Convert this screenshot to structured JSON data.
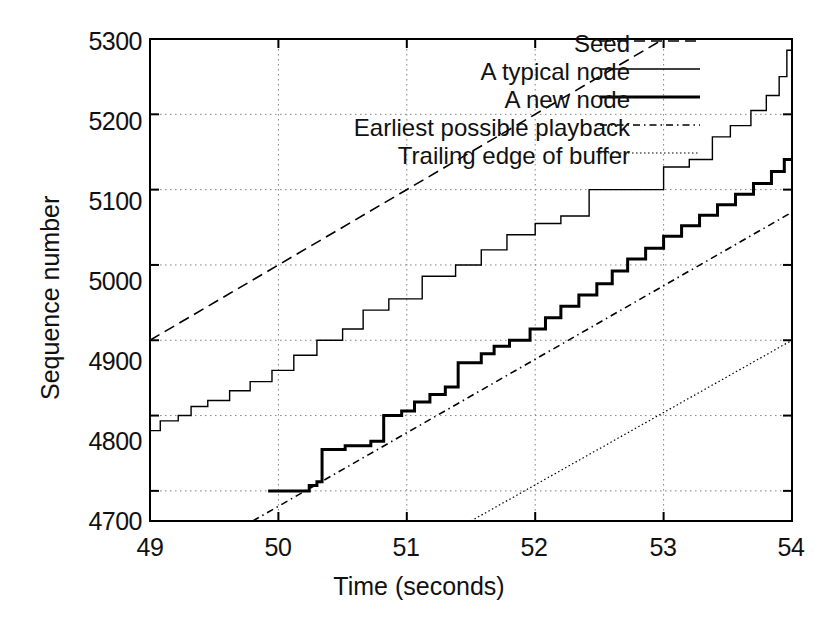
{
  "chart_data": {
    "type": "line",
    "title": "",
    "xlabel": "Time (seconds)",
    "ylabel": "Sequence number",
    "xlim": [
      49,
      54
    ],
    "ylim": [
      4660,
      5300
    ],
    "xticks": [
      49,
      50,
      51,
      52,
      53,
      54
    ],
    "yticks": [
      4700,
      4800,
      4900,
      5000,
      5100,
      5200,
      5300
    ],
    "grid": true,
    "legend_position": "top-center",
    "series": [
      {
        "name": "Seed",
        "style": "dashed",
        "width": 1.6,
        "note": "straight line, 100 sequence numbers per second, exits top of plot at t=53",
        "points": [
          [
            49,
            4900
          ],
          [
            53,
            5300
          ]
        ]
      },
      {
        "name": "A typical node",
        "style": "solid-thin",
        "width": 1.4,
        "note": "staircase, roughly 100 seq/sec average, starts 4780 ends 5290",
        "points": [
          [
            49.0,
            4780
          ],
          [
            49.08,
            4780
          ],
          [
            49.08,
            4793
          ],
          [
            49.22,
            4793
          ],
          [
            49.22,
            4800
          ],
          [
            49.32,
            4800
          ],
          [
            49.32,
            4812
          ],
          [
            49.45,
            4812
          ],
          [
            49.45,
            4820
          ],
          [
            49.62,
            4820
          ],
          [
            49.62,
            4833
          ],
          [
            49.78,
            4833
          ],
          [
            49.78,
            4845
          ],
          [
            49.95,
            4845
          ],
          [
            49.95,
            4860
          ],
          [
            50.12,
            4860
          ],
          [
            50.12,
            4880
          ],
          [
            50.3,
            4880
          ],
          [
            50.3,
            4900
          ],
          [
            50.5,
            4900
          ],
          [
            50.5,
            4915
          ],
          [
            50.66,
            4915
          ],
          [
            50.66,
            4940
          ],
          [
            50.86,
            4940
          ],
          [
            50.86,
            4955
          ],
          [
            51.12,
            4955
          ],
          [
            51.12,
            4985
          ],
          [
            51.38,
            4985
          ],
          [
            51.38,
            5000
          ],
          [
            51.58,
            5000
          ],
          [
            51.58,
            5020
          ],
          [
            51.78,
            5020
          ],
          [
            51.78,
            5040
          ],
          [
            52.0,
            5040
          ],
          [
            52.0,
            5055
          ],
          [
            52.2,
            5055
          ],
          [
            52.2,
            5065
          ],
          [
            52.42,
            5065
          ],
          [
            52.42,
            5100
          ],
          [
            53.0,
            5100
          ],
          [
            53.0,
            5130
          ],
          [
            53.2,
            5130
          ],
          [
            53.2,
            5140
          ],
          [
            53.38,
            5140
          ],
          [
            53.38,
            5170
          ],
          [
            53.52,
            5170
          ],
          [
            53.52,
            5185
          ],
          [
            53.68,
            5185
          ],
          [
            53.68,
            5205
          ],
          [
            53.8,
            5205
          ],
          [
            53.8,
            5225
          ],
          [
            53.9,
            5225
          ],
          [
            53.9,
            5250
          ],
          [
            53.96,
            5250
          ],
          [
            53.96,
            5285
          ],
          [
            54.0,
            5285
          ]
        ]
      },
      {
        "name": "A new node",
        "style": "solid-thick",
        "width": 3.0,
        "note": "flat at 4700 until t=50.3, then fine staircase up to 5140 at t=54",
        "points": [
          [
            49.92,
            4700
          ],
          [
            50.24,
            4700
          ],
          [
            50.24,
            4707
          ],
          [
            50.3,
            4707
          ],
          [
            50.3,
            4712
          ],
          [
            50.34,
            4712
          ],
          [
            50.34,
            4755
          ],
          [
            50.52,
            4755
          ],
          [
            50.52,
            4760
          ],
          [
            50.72,
            4760
          ],
          [
            50.72,
            4766
          ],
          [
            50.82,
            4766
          ],
          [
            50.82,
            4800
          ],
          [
            50.96,
            4800
          ],
          [
            50.96,
            4806
          ],
          [
            51.06,
            4806
          ],
          [
            51.06,
            4818
          ],
          [
            51.18,
            4818
          ],
          [
            51.18,
            4828
          ],
          [
            51.3,
            4828
          ],
          [
            51.3,
            4838
          ],
          [
            51.4,
            4838
          ],
          [
            51.4,
            4870
          ],
          [
            51.58,
            4870
          ],
          [
            51.58,
            4882
          ],
          [
            51.68,
            4882
          ],
          [
            51.68,
            4892
          ],
          [
            51.8,
            4892
          ],
          [
            51.8,
            4900
          ],
          [
            51.96,
            4900
          ],
          [
            51.96,
            4915
          ],
          [
            52.08,
            4915
          ],
          [
            52.08,
            4930
          ],
          [
            52.2,
            4930
          ],
          [
            52.2,
            4945
          ],
          [
            52.34,
            4945
          ],
          [
            52.34,
            4960
          ],
          [
            52.48,
            4960
          ],
          [
            52.48,
            4975
          ],
          [
            52.6,
            4975
          ],
          [
            52.6,
            4992
          ],
          [
            52.72,
            4992
          ],
          [
            52.72,
            5008
          ],
          [
            52.86,
            5008
          ],
          [
            52.86,
            5022
          ],
          [
            53.0,
            5022
          ],
          [
            53.0,
            5038
          ],
          [
            53.14,
            5038
          ],
          [
            53.14,
            5052
          ],
          [
            53.28,
            5052
          ],
          [
            53.28,
            5066
          ],
          [
            53.42,
            5066
          ],
          [
            53.42,
            5080
          ],
          [
            53.56,
            5080
          ],
          [
            53.56,
            5094
          ],
          [
            53.7,
            5094
          ],
          [
            53.7,
            5108
          ],
          [
            53.84,
            5108
          ],
          [
            53.84,
            5124
          ],
          [
            53.94,
            5124
          ],
          [
            53.94,
            5140
          ],
          [
            54.0,
            5140
          ]
        ]
      },
      {
        "name": "Earliest possible playback",
        "style": "dash-dot",
        "width": 1.6,
        "note": "straight line from bottom of plot at t=49.8 to 5070 at t=54",
        "points": [
          [
            49.8,
            4660
          ],
          [
            54,
            5070
          ]
        ]
      },
      {
        "name": "Trailing edge of buffer",
        "style": "dotted-fine",
        "width": 1.2,
        "note": "straight line from bottom of plot at t=51.5 to 4900 at t=54",
        "points": [
          [
            51.5,
            4660
          ],
          [
            54,
            4900
          ]
        ]
      }
    ],
    "legend": [
      "Seed",
      "A typical node",
      "A new node",
      "Earliest possible playback",
      "Trailing edge of buffer"
    ]
  },
  "axes": {
    "y_title": "Sequence number",
    "x_title": "Time (seconds)",
    "y_tick_labels": [
      "5300",
      "5200",
      "5100",
      "5000",
      "4900",
      "4800",
      "4700"
    ],
    "x_tick_labels": [
      "49",
      "50",
      "51",
      "52",
      "53",
      "54"
    ]
  },
  "legend": {
    "items": [
      {
        "label": "Seed",
        "key": "seed"
      },
      {
        "label": "A typical node",
        "key": "typical-node"
      },
      {
        "label": "A new node",
        "key": "new-node"
      },
      {
        "label": "Earliest possible playback",
        "key": "earliest-playback"
      },
      {
        "label": "Trailing edge of buffer",
        "key": "trailing-edge"
      }
    ]
  },
  "colors": {
    "ink": "#000000",
    "grid": "#808080",
    "background": "#ffffff"
  }
}
